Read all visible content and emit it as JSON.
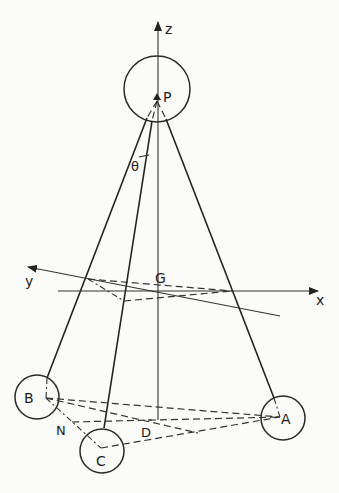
{
  "figure": {
    "type": "geometric diagram"
  },
  "axes": {
    "z": {
      "label": "z"
    },
    "y": {
      "label": "y"
    },
    "x": {
      "label": "x"
    }
  },
  "points": {
    "P": {
      "label": "P"
    },
    "G": {
      "label": "G"
    },
    "A": {
      "label": "A"
    },
    "B": {
      "label": "B"
    },
    "C": {
      "label": "C"
    },
    "N": {
      "label": "N"
    },
    "D": {
      "label": "D"
    }
  },
  "angles": {
    "theta": {
      "label": "θ"
    }
  },
  "colors": {
    "ink": "#222222",
    "paper": "#fbfbf9"
  }
}
